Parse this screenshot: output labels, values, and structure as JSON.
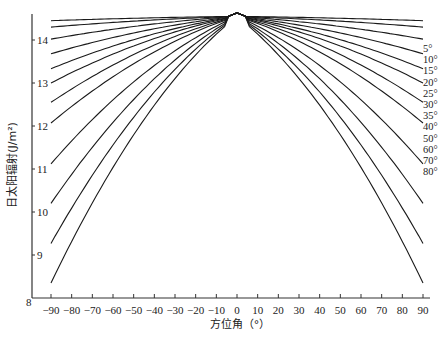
{
  "chart_data": {
    "type": "line",
    "title": "",
    "xlabel": "方位角（°）",
    "ylabel": "日太阳辐射(J/m²)",
    "xlim": [
      -90,
      90
    ],
    "ylim": [
      8,
      14.6
    ],
    "grid": false,
    "legend_position": "right, inline labels at curve ends",
    "x_ticks": [
      -90,
      -80,
      -70,
      -60,
      -50,
      -40,
      -30,
      -20,
      -10,
      0,
      10,
      20,
      30,
      40,
      50,
      60,
      70,
      80,
      90
    ],
    "x_tick_labels": [
      "−90",
      "−80",
      "−70",
      "−60",
      "−50",
      "−40",
      "−30",
      "−20",
      "−10",
      "0",
      "10",
      "20",
      "30",
      "40",
      "50",
      "60",
      "70",
      "80",
      "90"
    ],
    "y_ticks": [
      8,
      9,
      10,
      11,
      12,
      13,
      14
    ],
    "y_tick_labels": [
      "8",
      "9",
      "10",
      "11",
      "12",
      "13",
      "14"
    ],
    "peak_value_at_0": 14.6,
    "x": [
      -90,
      -60,
      -30,
      -15,
      0,
      15,
      30,
      60,
      90
    ],
    "series": [
      {
        "name": "5°",
        "values": [
          14.45,
          14.49,
          14.52,
          14.54,
          14.55,
          14.54,
          14.52,
          14.49,
          14.45
        ]
      },
      {
        "name": "10°",
        "values": [
          14.3,
          14.39,
          14.47,
          14.51,
          14.55,
          14.51,
          14.47,
          14.39,
          14.3
        ]
      },
      {
        "name": "15°",
        "values": [
          14.02,
          14.2,
          14.38,
          14.47,
          14.55,
          14.47,
          14.38,
          14.2,
          14.02
        ]
      },
      {
        "name": "20°",
        "values": [
          13.68,
          13.97,
          14.27,
          14.42,
          14.55,
          14.42,
          14.27,
          13.97,
          13.68
        ]
      },
      {
        "name": "25°",
        "values": [
          13.33,
          13.74,
          14.16,
          14.37,
          14.55,
          14.37,
          14.16,
          13.74,
          13.33
        ]
      },
      {
        "name": "30°",
        "values": [
          13.0,
          13.5,
          14.04,
          14.31,
          14.55,
          14.31,
          14.04,
          13.5,
          13.0
        ]
      },
      {
        "name": "35°",
        "values": [
          12.55,
          13.18,
          13.89,
          14.24,
          14.55,
          14.24,
          13.89,
          13.18,
          12.55
        ]
      },
      {
        "name": "40°",
        "values": [
          12.07,
          12.85,
          13.72,
          14.16,
          14.55,
          14.16,
          13.72,
          12.85,
          12.07
        ]
      },
      {
        "name": "50°",
        "values": [
          11.12,
          12.17,
          13.36,
          14.0,
          14.55,
          14.0,
          13.36,
          12.17,
          11.12
        ]
      },
      {
        "name": "60°",
        "values": [
          10.2,
          11.5,
          13.02,
          13.84,
          14.55,
          13.84,
          13.02,
          11.5,
          10.2
        ]
      },
      {
        "name": "70°",
        "values": [
          9.27,
          10.83,
          12.68,
          13.68,
          14.55,
          13.68,
          12.68,
          10.83,
          9.27
        ]
      },
      {
        "name": "80°",
        "values": [
          8.35,
          10.14,
          12.33,
          13.52,
          14.55,
          13.52,
          12.33,
          10.14,
          8.35
        ]
      }
    ]
  },
  "labels": {
    "ylabel": "日太阳辐射(J/m²)",
    "xlabel": "方位角（°）"
  }
}
